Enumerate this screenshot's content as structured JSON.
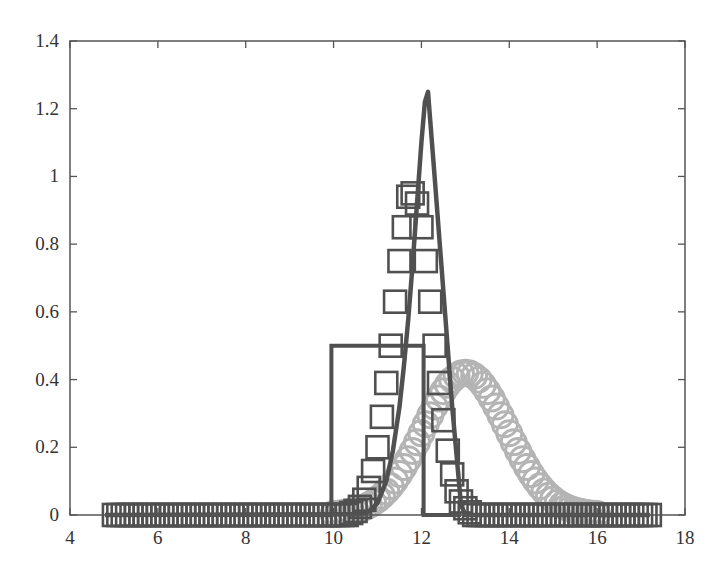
{
  "chart_data": {
    "type": "line",
    "title": "",
    "xlabel": "",
    "ylabel": "",
    "xlim": [
      4,
      18
    ],
    "ylim": [
      0,
      1.4
    ],
    "grid": false,
    "legend": null,
    "x_ticks": [
      4,
      6,
      8,
      10,
      12,
      14,
      16,
      18
    ],
    "x_tick_labels": [
      "4",
      "6",
      "8",
      "10",
      "12",
      "14",
      "16",
      "18"
    ],
    "y_ticks": [
      0,
      0.2,
      0.4,
      0.6,
      0.8,
      1,
      1.2,
      1.4
    ],
    "y_tick_labels": [
      "0",
      "0.2",
      "0.4",
      "0.6",
      "0.8",
      "1",
      "1.2",
      "1.4"
    ],
    "colors": {
      "axis": "#555555",
      "dark_series": "#505050",
      "light_series": "#b4b4b4"
    },
    "series": [
      {
        "name": "uniform-box",
        "style": "line",
        "color": "#505050",
        "x": [
          4.8,
          9.95,
          9.95,
          12.05,
          12.05,
          12.9
        ],
        "y": [
          0,
          0,
          0.5,
          0.5,
          0,
          0
        ]
      },
      {
        "name": "square-markers",
        "style": "markers-square",
        "color": "#505050",
        "x_start": 5.0,
        "x_step": 0.1,
        "x_end": 17.2,
        "nonzero_points": {
          "x": [
            10.4,
            10.5,
            10.6,
            10.7,
            10.8,
            10.9,
            11.0,
            11.1,
            11.2,
            11.3,
            11.4,
            11.5,
            11.6,
            11.7,
            11.8,
            11.9,
            12.0,
            12.1,
            12.2,
            12.3,
            12.4,
            12.5,
            12.6,
            12.7,
            12.8,
            12.9,
            13.0,
            13.1
          ],
          "y": [
            0.006,
            0.012,
            0.024,
            0.045,
            0.08,
            0.13,
            0.2,
            0.29,
            0.39,
            0.5,
            0.63,
            0.75,
            0.85,
            0.94,
            0.95,
            0.92,
            0.85,
            0.75,
            0.63,
            0.5,
            0.39,
            0.28,
            0.19,
            0.12,
            0.07,
            0.04,
            0.02,
            0.008
          ]
        }
      },
      {
        "name": "peaked-curve",
        "style": "line",
        "color": "#505050",
        "x": [
          4.8,
          10.6,
          10.8,
          11.0,
          11.2,
          11.35,
          11.5,
          11.6,
          11.7,
          11.8,
          11.9,
          12.0,
          12.08,
          12.15,
          12.3,
          12.5,
          12.7,
          12.9,
          13.0,
          17.2
        ],
        "y": [
          0,
          0.002,
          0.01,
          0.035,
          0.1,
          0.19,
          0.32,
          0.44,
          0.58,
          0.74,
          0.92,
          1.1,
          1.22,
          1.25,
          1.0,
          0.66,
          0.32,
          0.03,
          0,
          0
        ]
      },
      {
        "name": "circle-markers",
        "style": "markers-circle",
        "color": "#b4b4b4",
        "mean": 13.0,
        "sigma": 0.95,
        "peak": 0.42,
        "x": [
          10.0,
          10.2,
          10.4,
          10.6,
          10.8,
          11.0,
          11.2,
          11.4,
          11.6,
          11.8,
          12.0,
          12.2,
          12.4,
          12.6,
          12.8,
          13.0,
          13.2,
          13.4,
          13.6,
          13.8,
          14.0,
          14.2,
          14.4,
          14.6,
          14.8,
          15.0,
          15.2,
          15.4,
          15.6,
          15.8,
          16.0
        ],
        "y": [
          0.003,
          0.006,
          0.01,
          0.018,
          0.03,
          0.047,
          0.07,
          0.103,
          0.143,
          0.19,
          0.24,
          0.295,
          0.345,
          0.385,
          0.413,
          0.42,
          0.413,
          0.385,
          0.345,
          0.295,
          0.24,
          0.19,
          0.143,
          0.103,
          0.07,
          0.047,
          0.03,
          0.018,
          0.01,
          0.006,
          0.003
        ]
      }
    ]
  }
}
